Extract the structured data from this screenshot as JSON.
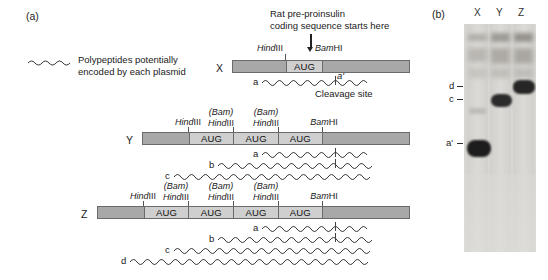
{
  "panels": {
    "a": {
      "label": "(a)"
    },
    "b": {
      "label": "(b)"
    }
  },
  "legend": {
    "line1": "Polypeptides potentially",
    "line2": "encoded by each plasmid",
    "icon": "wavy-line-icon"
  },
  "annotation": {
    "start_line1": "Rat pre-proinsulin",
    "start_line2": "coding sequence starts here",
    "cleavage_site": "Cleavage site",
    "arrow": "down-arrow-icon"
  },
  "constructs": [
    {
      "name": "X",
      "letter": "X",
      "sites": [
        {
          "label": "HindIII",
          "italic_part": "Hind",
          "roman_part": "III",
          "paren": ""
        },
        {
          "label": "BamHI",
          "italic_part": "Bam",
          "roman_part": "HI",
          "paren": ""
        }
      ],
      "segments": [
        {
          "shade": "dark",
          "text": ""
        },
        {
          "shade": "light",
          "text": "AUG"
        },
        {
          "shade": "dark",
          "text": ""
        }
      ],
      "aug_count": 1,
      "strands": [
        {
          "label": "a",
          "prime_label": "a'",
          "has_cleavage_tick": true
        }
      ]
    },
    {
      "name": "Y",
      "letter": "Y",
      "sites": [
        {
          "label": "HindIII",
          "italic_part": "Hind",
          "roman_part": "III",
          "paren": ""
        },
        {
          "label": "HindIII",
          "italic_part": "Hind",
          "roman_part": "III",
          "paren": "(Bam)"
        },
        {
          "label": "HindIII",
          "italic_part": "Hind",
          "roman_part": "III",
          "paren": "(Bam)"
        },
        {
          "label": "BamHI",
          "italic_part": "Bam",
          "roman_part": "HI",
          "paren": ""
        }
      ],
      "segments": [
        {
          "shade": "dark",
          "text": ""
        },
        {
          "shade": "light",
          "text": "AUG"
        },
        {
          "shade": "light",
          "text": "AUG"
        },
        {
          "shade": "light",
          "text": "AUG"
        },
        {
          "shade": "dark",
          "text": ""
        }
      ],
      "aug_count": 3,
      "strands": [
        {
          "label": "a",
          "prime_label": "",
          "has_cleavage_tick": true
        },
        {
          "label": "b",
          "prime_label": "",
          "has_cleavage_tick": true
        },
        {
          "label": "c",
          "prime_label": "",
          "has_cleavage_tick": false
        }
      ]
    },
    {
      "name": "Z",
      "letter": "Z",
      "sites": [
        {
          "label": "HindIII",
          "italic_part": "Hind",
          "roman_part": "III",
          "paren": ""
        },
        {
          "label": "HindIII",
          "italic_part": "Hind",
          "roman_part": "III",
          "paren": "(Bam)"
        },
        {
          "label": "HindIII",
          "italic_part": "Hind",
          "roman_part": "III",
          "paren": "(Bam)"
        },
        {
          "label": "HindIII",
          "italic_part": "Hind",
          "roman_part": "III",
          "paren": "(Bam)"
        },
        {
          "label": "BamHI",
          "italic_part": "Bam",
          "roman_part": "HI",
          "paren": ""
        }
      ],
      "segments": [
        {
          "shade": "dark",
          "text": ""
        },
        {
          "shade": "light",
          "text": "AUG"
        },
        {
          "shade": "light",
          "text": "AUG"
        },
        {
          "shade": "light",
          "text": "AUG"
        },
        {
          "shade": "light",
          "text": "AUG"
        },
        {
          "shade": "dark",
          "text": ""
        }
      ],
      "aug_count": 4,
      "strands": [
        {
          "label": "a",
          "prime_label": "",
          "has_cleavage_tick": true
        },
        {
          "label": "b",
          "prime_label": "",
          "has_cleavage_tick": true
        },
        {
          "label": "c",
          "prime_label": "",
          "has_cleavage_tick": false
        },
        {
          "label": "d",
          "prime_label": "",
          "has_cleavage_tick": false
        }
      ]
    }
  ],
  "gel": {
    "lanes": [
      {
        "label": "X",
        "band_marker": "a'"
      },
      {
        "label": "Y",
        "band_marker": "c"
      },
      {
        "label": "Z",
        "band_marker": "d"
      }
    ],
    "markers": [
      {
        "label": "d"
      },
      {
        "label": "c"
      },
      {
        "label": "a'"
      }
    ]
  },
  "colors": {
    "segment_dark": "#a8a8a8",
    "segment_light": "#cfcfcf",
    "outline": "#6a6a6a",
    "gel_background": "#d8d6d2",
    "band_dark": "#2b2b2b",
    "text": "#1a1a1a"
  }
}
